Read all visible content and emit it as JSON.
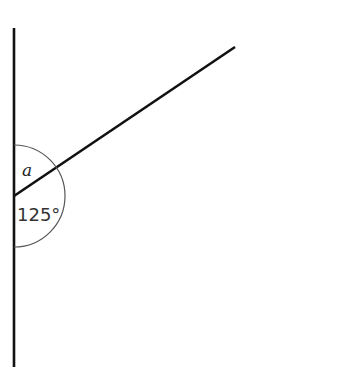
{
  "diagram": {
    "type": "angle-diagram",
    "labels": {
      "unknown_angle": "a",
      "known_angle": "125°"
    },
    "geometry": {
      "vertex": [
        14,
        196
      ],
      "vertical_line": {
        "x": 14,
        "y1": 28,
        "y2": 367
      },
      "ray_end": [
        235,
        47
      ],
      "arc_radius": 51
    },
    "colors": {
      "line": "#111111",
      "arc": "#555555",
      "background": "#ffffff"
    }
  }
}
